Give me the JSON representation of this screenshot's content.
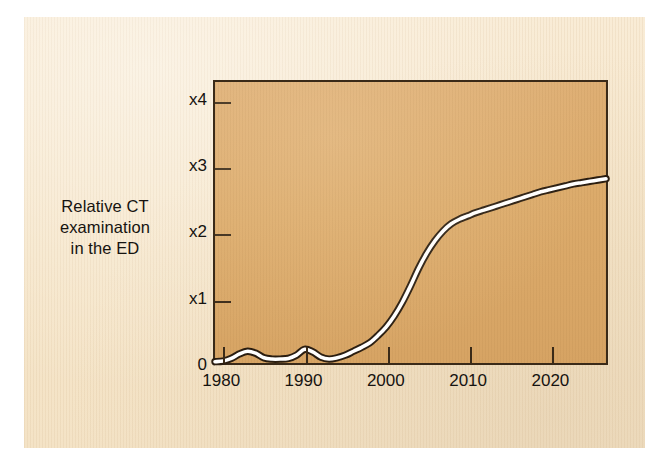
{
  "figure": {
    "paper_color": "#f6e6ca",
    "plot_background_color": "#dcab6b",
    "axis_color": "#3a2a18",
    "curve_fill_color": "#ffffff",
    "curve_outline_color": "#2a1d10",
    "text_color": "#161310"
  },
  "chart_data": {
    "type": "line",
    "title": "",
    "subtitle": "",
    "ylabel": "Relative CT\nexamination\nin the ED",
    "ylabel_lines": [
      "Relative CT",
      "examination",
      "in the ED"
    ],
    "xlabel": "",
    "grid": false,
    "legend": null,
    "legend_position": "none",
    "xlim": [
      1979,
      2027
    ],
    "ylim": [
      0,
      4.3
    ],
    "xticks": [
      1980,
      1990,
      2000,
      2010,
      2020
    ],
    "xticklabels": [
      "1980",
      "1990",
      "2000",
      "2010",
      "2020"
    ],
    "yticks": [
      0,
      1,
      2,
      3,
      4
    ],
    "yticklabels": [
      "0",
      "x1",
      "x2",
      "x3",
      "x4"
    ],
    "annotations": [],
    "series": [
      {
        "name": "Relative CT examination in the ED",
        "x": [
          1979,
          1980,
          1981,
          1982,
          1983,
          1984,
          1985,
          1986,
          1987,
          1988,
          1989,
          1990,
          1991,
          1992,
          1993,
          1994,
          1995,
          1996,
          1997,
          1998,
          1999,
          2000,
          2001,
          2002,
          2003,
          2004,
          2005,
          2006,
          2007,
          2008,
          2009,
          2010,
          2011,
          2012,
          2013,
          2014,
          2015,
          2016,
          2017,
          2018,
          2019,
          2020,
          2021,
          2022,
          2023,
          2024,
          2025,
          2026,
          2027
        ],
        "values": [
          0.02,
          0.03,
          0.07,
          0.14,
          0.18,
          0.15,
          0.08,
          0.06,
          0.06,
          0.07,
          0.12,
          0.21,
          0.17,
          0.09,
          0.06,
          0.08,
          0.12,
          0.18,
          0.24,
          0.31,
          0.42,
          0.55,
          0.72,
          0.93,
          1.18,
          1.45,
          1.68,
          1.87,
          2.02,
          2.13,
          2.2,
          2.25,
          2.3,
          2.34,
          2.38,
          2.42,
          2.46,
          2.5,
          2.54,
          2.58,
          2.62,
          2.65,
          2.68,
          2.71,
          2.74,
          2.76,
          2.78,
          2.8,
          2.82
        ]
      }
    ]
  }
}
